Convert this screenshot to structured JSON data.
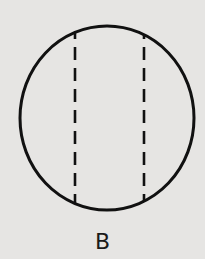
{
  "figure": {
    "label": "B",
    "shape": "circle",
    "dashed_lines": 2,
    "colors": {
      "background": "#e6e5e3",
      "stroke": "#111111"
    }
  }
}
